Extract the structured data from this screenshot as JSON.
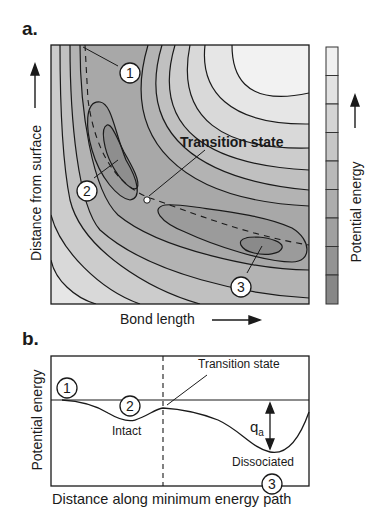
{
  "panel_a": {
    "label": "a.",
    "y_axis_label": "Distance from surface",
    "x_axis_label": "Bond length",
    "colorbar_label": "Potential energy",
    "annotation": "Transition state",
    "markers": [
      "1",
      "2",
      "3"
    ],
    "colorbar_bands": [
      "#f0f0f0",
      "#e2e2e2",
      "#d4d4d4",
      "#c6c6c6",
      "#b9b9b9",
      "#adadad",
      "#a0a0a0",
      "#939393",
      "#878787"
    ]
  },
  "panel_b": {
    "label": "b.",
    "y_axis_label": "Potential energy",
    "x_axis_label": "Distance along minimum energy path",
    "annotation": "Transition state",
    "intact_label": "Intact",
    "dissociated_label": "Dissociated",
    "qa_label": "q",
    "qa_subscript": "a",
    "markers": [
      "1",
      "2",
      "3"
    ]
  },
  "colors": {
    "line": "#1a1a1a",
    "background": "#ffffff"
  }
}
